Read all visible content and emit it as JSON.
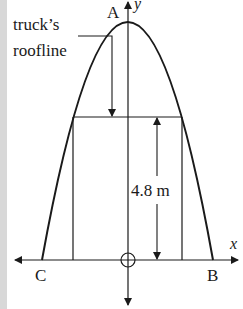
{
  "diagram": {
    "labels": {
      "apex": "A",
      "left_root": "C",
      "right_root": "B",
      "x_axis": "x",
      "y_axis": "y",
      "roofline_line1": "truck’s",
      "roofline_line2": "roofline",
      "height": "4.8 m"
    },
    "colors": {
      "stroke": "#1a1a1a",
      "background": "#ffffff",
      "strip": "#d8d8d8"
    },
    "geometry": {
      "origin": [
        128,
        260
      ],
      "apex": [
        128,
        22
      ],
      "C": [
        42,
        260
      ],
      "B": [
        213,
        260
      ],
      "truck_left_x": 73,
      "truck_right_x": 182,
      "truck_top_y": 117,
      "dimension_x": 157
    }
  }
}
